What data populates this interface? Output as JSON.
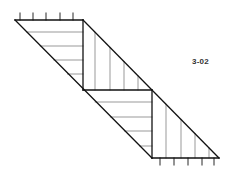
{
  "figure": {
    "label": "3-02",
    "colors": {
      "stroke": "#111111",
      "hatch": "#555555",
      "background": "#ffffff",
      "label": "#333333"
    },
    "outline": {
      "left_diagonal": [
        [
          15,
          20
        ],
        [
          152,
          158
        ]
      ],
      "right_diagonal": [
        [
          83,
          20
        ],
        [
          219,
          158
        ]
      ],
      "top_edge": [
        [
          15,
          20
        ],
        [
          83,
          20
        ]
      ],
      "step_vertical_1": [
        [
          83,
          20
        ],
        [
          83,
          90
        ]
      ],
      "step_horizontal": [
        [
          83,
          90
        ],
        [
          152,
          90
        ]
      ],
      "step_vertical_2": [
        [
          152,
          90
        ],
        [
          152,
          158
        ]
      ],
      "bottom_edge": [
        [
          152,
          158
        ],
        [
          219,
          158
        ]
      ]
    },
    "top_ticks_x": [
      20,
      33,
      46,
      60,
      73
    ],
    "bottom_ticks_x": [
      160,
      174,
      188,
      202,
      214
    ],
    "hatching": {
      "upper_left_horizontal": [
        [
          26.7,
          32
        ],
        [
          40.3,
          46
        ],
        [
          53.9,
          60
        ],
        [
          67.5,
          74
        ]
      ],
      "upper_right_vertical": [
        [
          95,
          32.2
        ],
        [
          110,
          47.4
        ],
        [
          124,
          61.6
        ],
        [
          138,
          75.8
        ]
      ],
      "lower_left_horizontal": [
        [
          95.2,
          102
        ],
        [
          110.4,
          117
        ],
        [
          124.6,
          131
        ],
        [
          139.8,
          146
        ]
      ],
      "lower_right_vertical": [
        [
          166,
          104.2
        ],
        [
          181,
          119.4
        ],
        [
          195,
          133.6
        ],
        [
          209,
          147.9
        ]
      ]
    }
  }
}
